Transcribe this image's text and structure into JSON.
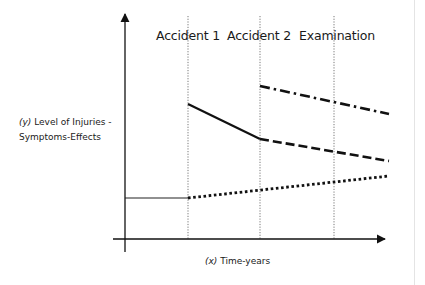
{
  "diagram": {
    "y_axis": {
      "prefix": "(y)",
      "line1": " Level of Injuries -",
      "line2": "Symptoms-Effects"
    },
    "x_axis": {
      "prefix": "(x)",
      "label": " Time-years"
    },
    "events": [
      {
        "label": "Accident 1",
        "x": 188
      },
      {
        "label": "Accident 2",
        "x": 260
      },
      {
        "label": "Examination",
        "x": 334
      }
    ],
    "series": [
      {
        "name": "baseline",
        "style": "solid-thin",
        "points": [
          [
            125,
            198
          ],
          [
            188,
            198
          ]
        ]
      },
      {
        "name": "natural-progression",
        "style": "dotted",
        "points": [
          [
            188,
            198
          ],
          [
            389,
            176
          ]
        ]
      },
      {
        "name": "accident-1-effect",
        "style": "solid-thick",
        "points": [
          [
            188,
            104
          ],
          [
            260,
            139
          ]
        ]
      },
      {
        "name": "accident-1-continued",
        "style": "dashed",
        "points": [
          [
            260,
            139
          ],
          [
            389,
            161
          ]
        ]
      },
      {
        "name": "accident-2-effect",
        "style": "dash-dot",
        "points": [
          [
            260,
            86
          ],
          [
            389,
            114
          ]
        ]
      }
    ],
    "colors": {
      "line": "#111111",
      "guide": "#555555",
      "border": "#e4e4e4"
    }
  }
}
